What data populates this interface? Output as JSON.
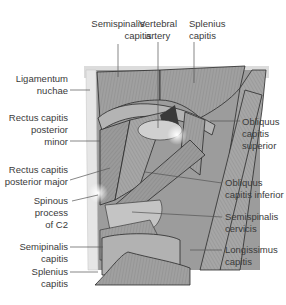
{
  "figure": {
    "labels": {
      "semispinalis_capitis_top": [
        "Semispinalis",
        "capitis"
      ],
      "vertebral_artery": [
        "Vertebral",
        "artery"
      ],
      "splenius_capitis_top": [
        "Splenius",
        "capitis"
      ],
      "ligamentum_nuchae": [
        "Ligamentum",
        "nuchae"
      ],
      "rectus_capitis_posterior_minor": [
        "Rectus capitis",
        "posterior",
        "minor"
      ],
      "obliquus_capitis_superior": [
        "Obliquus",
        "capitis",
        "superior"
      ],
      "rectus_capitis_posterior_major": [
        "Rectus capitis",
        "posterior major"
      ],
      "obliquus_capitis_inferior": [
        "Obliquus",
        "capitis inferior"
      ],
      "spinous_process_c2": [
        "Spinous",
        "process",
        "of C2"
      ],
      "semispinalis_cervicis": [
        "Semispinalis",
        "cervicis"
      ],
      "semipinalis_capitis_bottom": [
        "Semipinalis",
        "capitis"
      ],
      "longissimus_capitis": [
        "Longissimus",
        "capitis"
      ],
      "splenius_capitis_bottom": [
        "Splenius",
        "capitis"
      ]
    },
    "colors": {
      "muscle_dark": "#8a8a8a",
      "muscle_mid": "#a8a8a8",
      "muscle_light": "#c8c8c8",
      "bone": "#d8d8d8",
      "outline": "#2a2a2a",
      "leader": "#555555",
      "text": "#3a3a3a"
    }
  }
}
